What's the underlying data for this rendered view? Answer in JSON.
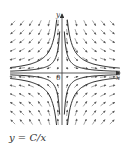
{
  "figure": {
    "caption": "y = C/x",
    "x_axis_label": "x",
    "y_axis_label": "y",
    "origin_label": "0"
  },
  "style": {
    "axis_color": "#333333",
    "arrow_color": "#555555",
    "curve_color": "#333333"
  }
}
